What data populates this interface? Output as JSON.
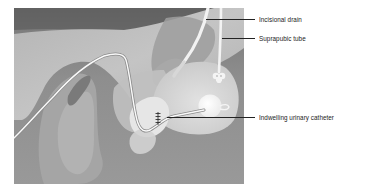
{
  "figure": {
    "colors": {
      "background_dark": "#6e6e6e",
      "tissue_mid": "#a9a9a9",
      "tissue_light": "#c8c8c8",
      "bladder": "#d9d9d9",
      "tube": "#f7f7f7",
      "leader_line": "#222222",
      "label_text": "#1a1a1a"
    }
  },
  "labels": [
    {
      "id": "incisional-drain",
      "text": "Incisional drain"
    },
    {
      "id": "suprapubic-tube",
      "text": "Suprapubic tube"
    },
    {
      "id": "indwelling-urinary-catheter",
      "text": "Indwelling urinary catheter"
    }
  ]
}
